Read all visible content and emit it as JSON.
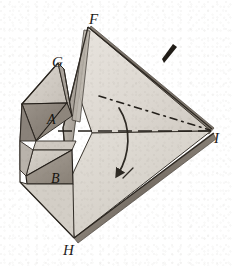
{
  "figure": {
    "kind": "crystal-polyhedron-diagram",
    "medium": "engraving",
    "background_color": "#ffffff",
    "ink_color": "#2a2622",
    "canvas": {
      "width": 232,
      "height": 266
    },
    "vertex_labels": [
      {
        "id": "F",
        "text": "F",
        "x": 89,
        "y": 12,
        "role": "top-apex"
      },
      {
        "id": "G",
        "text": "G",
        "x": 52,
        "y": 55,
        "role": "upper-left-apex"
      },
      {
        "id": "I",
        "text": "I",
        "x": 214,
        "y": 131,
        "role": "right-apex"
      },
      {
        "id": "H",
        "text": "H",
        "x": 63,
        "y": 243,
        "role": "bottom-apex"
      }
    ],
    "face_labels": [
      {
        "id": "A",
        "text": "A",
        "x": 47,
        "y": 113,
        "role": "upper-dark-face"
      },
      {
        "id": "B",
        "text": "B",
        "x": 51,
        "y": 172,
        "role": "lower-dark-face"
      }
    ],
    "annotations": {
      "axis_line": {
        "style": "dash-dot",
        "from": "upper-left",
        "to": "I",
        "description": "dash-dot optic axis running to vertex I"
      },
      "equator_line": {
        "style": "dashed",
        "description": "horizontal dashed line through the body to vertex I"
      },
      "rotation_arrow": {
        "style": "curved-arrow",
        "direction": "downward",
        "description": "curved arrow indicating rotation about the axis"
      },
      "tick_mark": {
        "style": "tapered-stroke",
        "x": 168,
        "y": 52,
        "description": "short dark tapered index stroke upper right"
      }
    },
    "tones": {
      "face_light": "#ded9d2",
      "face_lighter": "#e6e2dc",
      "face_mid": "#c3bdb5",
      "face_mid_2": "#b4ada3",
      "face_dark": "#8e867c",
      "face_darker": "#7b736a",
      "edge_shadow": "#6d655c",
      "outline": "#2a2622"
    }
  }
}
